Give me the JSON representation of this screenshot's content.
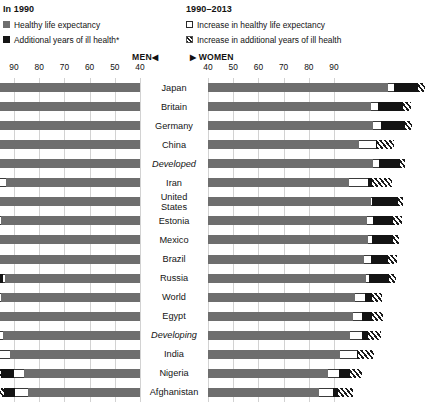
{
  "legend": {
    "left": {
      "title": "In 1990",
      "items": [
        {
          "label": "Healthy life expectancy",
          "swatch": "healthy-swatch",
          "color": "#6e6e6e"
        },
        {
          "label": "Additional years of ill health*",
          "swatch": "ill-health-swatch",
          "color": "#151515"
        }
      ]
    },
    "right": {
      "title": "1990–2013",
      "items": [
        {
          "label": "Increase in healthy life expectancy",
          "swatch": "increase-healthy-swatch",
          "color": "#ffffff"
        },
        {
          "label": "Increase in additional years of ill health",
          "swatch": "increase-ill-health-swatch",
          "color": "hatched"
        }
      ]
    }
  },
  "axes": {
    "men_tag": "MEN",
    "women_tag": "WOMEN",
    "men_arrow": "◀",
    "women_arrow": "▶",
    "men_ticks": [
      90,
      80,
      70,
      60,
      50,
      40
    ],
    "women_ticks": [
      40,
      50,
      60,
      70,
      80,
      90
    ]
  },
  "chart_data": {
    "type": "bar",
    "xlabel": "Years",
    "ylabel": "",
    "orientation": "horizontal-diverging",
    "xlim_men": [
      90,
      40
    ],
    "xlim_women": [
      40,
      90
    ],
    "grid": true,
    "legend_position": "top",
    "series": [
      {
        "name": "Healthy life expectancy",
        "key": "healthy"
      },
      {
        "name": "Increase in healthy life expectancy",
        "key": "inc_healthy"
      },
      {
        "name": "Additional years of ill health",
        "key": "ill"
      },
      {
        "name": "Increase in additional years of ill health",
        "key": "inc_ill"
      }
    ],
    "categories": [
      "Japan",
      "Britain",
      "Germany",
      "China",
      "Developed",
      "Iran",
      "United States",
      "Estonia",
      "Mexico",
      "Brazil",
      "Russia",
      "World",
      "Egypt",
      "Developing",
      "India",
      "Nigeria",
      "Afghanistan"
    ],
    "rows": [
      {
        "country": "Japan",
        "italic": false,
        "men": {
          "healthy": 66.8,
          "inc_healthy": 4.0,
          "ill": 8.0,
          "inc_ill": 1.5
        },
        "women": {
          "healthy": 71.5,
          "inc_healthy": 2.5,
          "ill": 9.5,
          "inc_ill": 2.5
        }
      },
      {
        "country": "Britain",
        "italic": false,
        "men": {
          "healthy": 63.5,
          "inc_healthy": 4.0,
          "ill": 8.5,
          "inc_ill": 3.0
        },
        "women": {
          "healthy": 64.5,
          "inc_healthy": 3.0,
          "ill": 10.0,
          "inc_ill": 3.0
        }
      },
      {
        "country": "Germany",
        "italic": false,
        "men": {
          "healthy": 63.0,
          "inc_healthy": 4.0,
          "ill": 8.0,
          "inc_ill": 3.5
        },
        "women": {
          "healthy": 65.5,
          "inc_healthy": 3.0,
          "ill": 9.5,
          "inc_ill": 3.0
        }
      },
      {
        "country": "China",
        "italic": false,
        "men": {
          "healthy": 58.0,
          "inc_healthy": 6.0,
          "ill": 0.5,
          "inc_ill": 7.0
        },
        "women": {
          "healthy": 60.0,
          "inc_healthy": 6.5,
          "ill": 0.5,
          "inc_ill": 7.0
        }
      },
      {
        "country": "Developed",
        "italic": true,
        "men": {
          "healthy": 61.5,
          "inc_healthy": 3.5,
          "ill": 7.0,
          "inc_ill": 2.0
        },
        "women": {
          "healthy": 65.5,
          "inc_healthy": 2.5,
          "ill": 8.0,
          "inc_ill": 2.0
        }
      },
      {
        "country": "Iran",
        "italic": false,
        "men": {
          "healthy": 53.0,
          "inc_healthy": 9.5,
          "ill": 0.5,
          "inc_ill": 7.5
        },
        "women": {
          "healthy": 56.0,
          "inc_healthy": 7.5,
          "ill": 1.5,
          "inc_ill": 8.0
        }
      },
      {
        "country": "United States",
        "italic": false,
        "men": {
          "healthy": 61.5,
          "inc_healthy": 2.5,
          "ill": 8.5,
          "inc_ill": 2.0
        },
        "women": {
          "healthy": 64.5,
          "inc_healthy": 0.5,
          "ill": 10.5,
          "inc_ill": 2.0
        }
      },
      {
        "country": "Estonia",
        "italic": false,
        "men": {
          "healthy": 55.0,
          "inc_healthy": 5.0,
          "ill": 2.0,
          "inc_ill": 6.5
        },
        "women": {
          "healthy": 63.0,
          "inc_healthy": 2.5,
          "ill": 8.0,
          "inc_ill": 3.5
        }
      },
      {
        "country": "Mexico",
        "italic": false,
        "men": {
          "healthy": 60.5,
          "inc_healthy": 2.5,
          "ill": 7.5,
          "inc_ill": 1.0
        },
        "women": {
          "healthy": 63.5,
          "inc_healthy": 1.5,
          "ill": 8.5,
          "inc_ill": 2.5
        }
      },
      {
        "country": "Brazil",
        "italic": false,
        "men": {
          "healthy": 56.5,
          "inc_healthy": 4.5,
          "ill": 4.0,
          "inc_ill": 4.0
        },
        "women": {
          "healthy": 62.0,
          "inc_healthy": 2.5,
          "ill": 7.0,
          "inc_ill": 3.5
        }
      },
      {
        "country": "Russia",
        "italic": false,
        "men": {
          "healthy": 53.5,
          "inc_healthy": 1.0,
          "ill": 7.0,
          "inc_ill": 0.0
        },
        "women": {
          "healthy": 62.5,
          "inc_healthy": 1.5,
          "ill": 8.0,
          "inc_ill": 2.5
        }
      },
      {
        "country": "World",
        "italic": false,
        "men": {
          "healthy": 55.0,
          "inc_healthy": 5.0,
          "ill": 0.5,
          "inc_ill": 5.0
        },
        "women": {
          "healthy": 58.5,
          "inc_healthy": 4.0,
          "ill": 2.5,
          "inc_ill": 4.0
        }
      },
      {
        "country": "Egypt",
        "italic": false,
        "men": {
          "healthy": 55.5,
          "inc_healthy": 4.0,
          "ill": 4.0,
          "inc_ill": 4.5
        },
        "women": {
          "healthy": 57.5,
          "inc_healthy": 3.5,
          "ill": 4.0,
          "inc_ill": 4.5
        }
      },
      {
        "country": "Developing",
        "italic": true,
        "men": {
          "healthy": 54.5,
          "inc_healthy": 4.5,
          "ill": 2.5,
          "inc_ill": 5.0
        },
        "women": {
          "healthy": 56.5,
          "inc_healthy": 4.5,
          "ill": 2.5,
          "inc_ill": 5.0
        }
      },
      {
        "country": "India",
        "italic": false,
        "men": {
          "healthy": 51.5,
          "inc_healthy": 6.0,
          "ill": 1.0,
          "inc_ill": 6.0
        },
        "women": {
          "healthy": 52.5,
          "inc_healthy": 6.5,
          "ill": 0.5,
          "inc_ill": 6.5
        }
      },
      {
        "country": "Nigeria",
        "italic": false,
        "men": {
          "healthy": 46.0,
          "inc_healthy": 4.0,
          "ill": 5.0,
          "inc_ill": 5.5
        },
        "women": {
          "healthy": 47.5,
          "inc_healthy": 4.5,
          "ill": 4.5,
          "inc_ill": 4.5
        }
      },
      {
        "country": "Afghanistan",
        "italic": false,
        "men": {
          "healthy": 44.5,
          "inc_healthy": 5.0,
          "ill": 4.5,
          "inc_ill": 6.0
        },
        "women": {
          "healthy": 44.0,
          "inc_healthy": 5.5,
          "ill": 2.0,
          "inc_ill": 6.0
        }
      }
    ]
  }
}
